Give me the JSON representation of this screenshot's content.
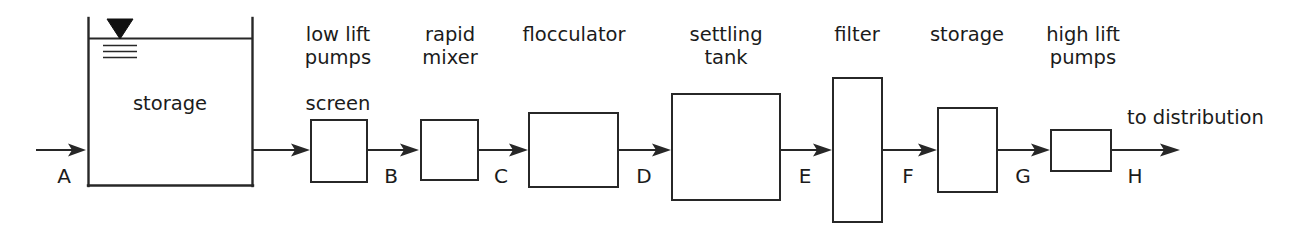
{
  "diagram": {
    "type": "process-flow",
    "background_color": "#ffffff",
    "line_color": "#272727",
    "units": [
      {
        "id": "storage-tank",
        "label": "storage",
        "label_position": "inside",
        "shape": "open-top-tank",
        "has_water_level_indicator": true
      },
      {
        "id": "screen",
        "label": "screen",
        "label_position": "above",
        "shape": "rectangle"
      },
      {
        "id": "low-lift-pumps",
        "label": "low lift\npumps",
        "label_line1": "low lift",
        "label_line2": "pumps",
        "label_position": "above",
        "shape": "label-only"
      },
      {
        "id": "rapid-mixer",
        "label_line1": "rapid",
        "label_line2": "mixer",
        "label_position": "above",
        "shape": "rectangle"
      },
      {
        "id": "flocculator",
        "label_line1": "flocculator",
        "label_line2": "",
        "label_position": "above",
        "shape": "rectangle"
      },
      {
        "id": "settling-tank",
        "label_line1": "settling",
        "label_line2": "tank",
        "label_position": "above",
        "shape": "rectangle"
      },
      {
        "id": "filter",
        "label_line1": "filter",
        "label_line2": "",
        "label_position": "above",
        "shape": "tall-rectangle"
      },
      {
        "id": "clear-well-storage",
        "label_line1": "storage",
        "label_line2": "",
        "label_position": "above",
        "shape": "rectangle"
      },
      {
        "id": "high-lift-pumps",
        "label_line1": "high lift",
        "label_line2": "pumps",
        "label_position": "above",
        "shape": "rectangle"
      }
    ],
    "stream_points": [
      {
        "id": "A",
        "label": "A"
      },
      {
        "id": "B",
        "label": "B"
      },
      {
        "id": "C",
        "label": "C"
      },
      {
        "id": "D",
        "label": "D"
      },
      {
        "id": "E",
        "label": "E"
      },
      {
        "id": "F",
        "label": "F"
      },
      {
        "id": "G",
        "label": "G"
      },
      {
        "id": "H",
        "label": "H"
      }
    ],
    "terminal_label": "to distribution"
  }
}
